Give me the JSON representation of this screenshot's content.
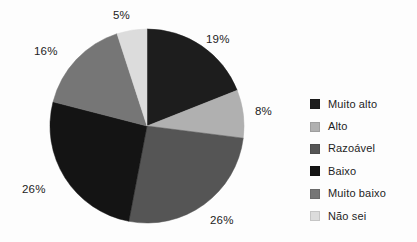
{
  "chart_data": {
    "type": "pie",
    "title": "",
    "subtitle": "",
    "xlabel": "",
    "ylabel": "",
    "grid": false,
    "legend_position": "right",
    "start_angle_deg": 0,
    "direction": "clockwise",
    "categories": [
      "Muito alto",
      "Alto",
      "Razoável",
      "Baixo",
      "Muito baixo",
      "Não sei"
    ],
    "values": [
      19,
      8,
      26,
      26,
      16,
      5
    ],
    "value_unit": "%",
    "colors": [
      "#1d1d1d",
      "#b0b0b0",
      "#555555",
      "#141414",
      "#767676",
      "#dcdcdc"
    ],
    "slices": [
      {
        "label": "Muito alto",
        "value": 19,
        "display": "19%",
        "color": "#1d1d1d"
      },
      {
        "label": "Alto",
        "value": 8,
        "display": "8%",
        "color": "#b0b0b0"
      },
      {
        "label": "Razoável",
        "value": 26,
        "display": "26%",
        "color": "#555555"
      },
      {
        "label": "Baixo",
        "value": 26,
        "display": "26%",
        "color": "#141414"
      },
      {
        "label": "Muito baixo",
        "value": 16,
        "display": "16%",
        "color": "#767676"
      },
      {
        "label": "Não sei",
        "value": 5,
        "display": "5%",
        "color": "#dcdcdc"
      }
    ]
  },
  "labels": {
    "muito_alto": "19%",
    "alto": "8%",
    "razoavel": "26%",
    "baixo": "26%",
    "muito_baixo": "16%",
    "nao_sei": "5%"
  },
  "legend": {
    "items": [
      {
        "label": "Muito alto",
        "color": "#1d1d1d"
      },
      {
        "label": "Alto",
        "color": "#b0b0b0"
      },
      {
        "label": "Razoável",
        "color": "#555555"
      },
      {
        "label": "Baixo",
        "color": "#141414"
      },
      {
        "label": "Muito baixo",
        "color": "#767676"
      },
      {
        "label": "Não sei",
        "color": "#dcdcdc"
      }
    ]
  }
}
